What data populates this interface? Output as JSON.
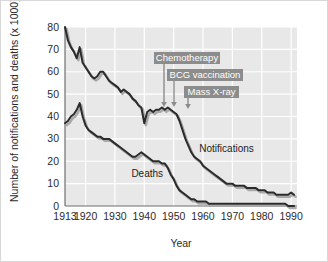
{
  "chart_data": {
    "type": "line",
    "title": "",
    "xlabel": "Year",
    "ylabel": "Number of notifications and deaths (x 1000)",
    "xlim": [
      1913,
      1992
    ],
    "ylim": [
      0,
      80
    ],
    "xticks": [
      "1913",
      "1920",
      "1930",
      "1940",
      "1950",
      "1960",
      "1970",
      "1980",
      "1990"
    ],
    "xtick_values": [
      1913,
      1920,
      1930,
      1940,
      1950,
      1960,
      1970,
      1980,
      1990
    ],
    "yticks": [
      "0",
      "10",
      "20",
      "30",
      "40",
      "50",
      "60",
      "70",
      "80"
    ],
    "ytick_values": [
      0,
      10,
      20,
      30,
      40,
      50,
      60,
      70,
      80
    ],
    "grid": true,
    "legend_position": "inline-labels",
    "plot_background": "#e8e8e8",
    "grid_color": "#ffffff",
    "line_color": "#2b2b2b",
    "shadow_color": "#a9a9a9",
    "annotation_box_color": "#8c8c8c",
    "series": [
      {
        "name": "Notifications",
        "label_x": 1968,
        "label_y": 24,
        "x": [
          1913,
          1914,
          1915,
          1916,
          1917,
          1918,
          1919,
          1920,
          1921,
          1922,
          1923,
          1924,
          1925,
          1926,
          1927,
          1928,
          1929,
          1930,
          1931,
          1932,
          1933,
          1934,
          1935,
          1936,
          1937,
          1938,
          1939,
          1940,
          1941,
          1942,
          1943,
          1944,
          1945,
          1946,
          1947,
          1948,
          1949,
          1950,
          1951,
          1952,
          1953,
          1954,
          1955,
          1956,
          1957,
          1958,
          1959,
          1960,
          1961,
          1962,
          1963,
          1964,
          1965,
          1966,
          1967,
          1968,
          1969,
          1970,
          1971,
          1972,
          1973,
          1974,
          1975,
          1976,
          1977,
          1978,
          1979,
          1980,
          1981,
          1982,
          1983,
          1984,
          1985,
          1986,
          1987,
          1988,
          1989,
          1990,
          1991
        ],
        "y": [
          80,
          74,
          71,
          69,
          66,
          71,
          64,
          62,
          60,
          58,
          57,
          58,
          60,
          60,
          58,
          56,
          55,
          54,
          53,
          51,
          52,
          51,
          50,
          48,
          47,
          45,
          44,
          37,
          42,
          43,
          42,
          43,
          43,
          44,
          43,
          44,
          43,
          42,
          41,
          38,
          34,
          30,
          27,
          24,
          22,
          21,
          20,
          18,
          17,
          16,
          15,
          14,
          13,
          12,
          11,
          10,
          10,
          10,
          9,
          9,
          9,
          9,
          8,
          8,
          8,
          8,
          7,
          7,
          7,
          6,
          6,
          6,
          5,
          5,
          5,
          5,
          5,
          6,
          5
        ]
      },
      {
        "name": "Deaths",
        "label_x": 1941,
        "label_y": 13,
        "x": [
          1913,
          1914,
          1915,
          1916,
          1917,
          1918,
          1919,
          1920,
          1921,
          1922,
          1923,
          1924,
          1925,
          1926,
          1927,
          1928,
          1929,
          1930,
          1931,
          1932,
          1933,
          1934,
          1935,
          1936,
          1937,
          1938,
          1939,
          1940,
          1941,
          1942,
          1943,
          1944,
          1945,
          1946,
          1947,
          1948,
          1949,
          1950,
          1951,
          1952,
          1953,
          1954,
          1955,
          1956,
          1957,
          1958,
          1959,
          1960,
          1961,
          1962,
          1963,
          1964,
          1965,
          1966,
          1967,
          1968,
          1969,
          1970,
          1971,
          1972,
          1973,
          1974,
          1975,
          1976,
          1977,
          1978,
          1979,
          1980,
          1981,
          1982,
          1983,
          1984,
          1985,
          1986,
          1987,
          1988,
          1989,
          1990,
          1991
        ],
        "y": [
          37,
          38,
          40,
          41,
          43,
          46,
          40,
          36,
          34,
          33,
          32,
          31,
          31,
          30,
          30,
          30,
          29,
          28,
          27,
          26,
          25,
          24,
          23,
          22,
          22,
          23,
          24,
          23,
          22,
          21,
          20,
          20,
          20,
          19,
          19,
          17,
          14,
          12,
          9,
          7,
          6,
          5,
          4,
          3,
          3,
          2,
          2,
          2,
          2,
          1,
          1,
          1,
          1,
          1,
          1,
          1,
          1,
          1,
          1,
          1,
          1,
          1,
          1,
          1,
          1,
          1,
          1,
          1,
          1,
          1,
          1,
          1,
          1,
          1,
          1,
          1,
          0,
          0,
          0
        ]
      }
    ],
    "annotations": [
      {
        "label": "Chemotherapy",
        "arrow_year": 1947,
        "box_x": 153,
        "box_y": 51,
        "box_w": 66,
        "box_h": 12,
        "arrow_x": 163,
        "arrow_top": 63,
        "arrow_bottom": 106
      },
      {
        "label": "BCG vaccination",
        "arrow_year": 1950,
        "box_x": 166,
        "box_y": 68,
        "box_w": 76,
        "box_h": 12,
        "arrow_x": 173,
        "arrow_top": 80,
        "arrow_bottom": 106
      },
      {
        "label": "Mass X-ray",
        "arrow_year": 1953,
        "box_x": 183,
        "box_y": 85,
        "box_w": 55,
        "box_h": 12,
        "arrow_x": 187,
        "arrow_top": 97,
        "arrow_bottom": 108
      }
    ]
  }
}
